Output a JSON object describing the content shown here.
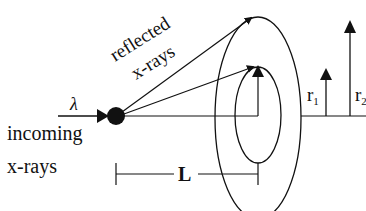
{
  "diagram": {
    "type": "x-ray diffraction geometry",
    "labels": {
      "reflected": "reflected",
      "x_rays_reflected": "x-rays",
      "lambda": "λ",
      "incoming": "incoming",
      "x_rays_incoming": "x-rays",
      "distance": "L",
      "r1": "r",
      "r1_sub": "1",
      "r2": "r",
      "r2_sub": "2"
    },
    "colors": {
      "line": "#111111",
      "background": "#ffffff"
    }
  }
}
